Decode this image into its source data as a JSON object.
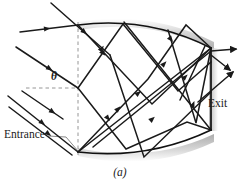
{
  "figure": {
    "caption": "(a)",
    "labels": {
      "entrance": "Entrance",
      "exit": "Exit",
      "angle": "θ"
    },
    "colors": {
      "ray": "#1a1a1a",
      "surface": "#111111",
      "shadow": "#b9b9b9",
      "dashed_guide": "#8a8a8a",
      "leader": "#7a7a7a",
      "background": "#ffffff",
      "text": "#1a1a1a"
    },
    "geometry": {
      "top_surface": "curved arc from (78,25) through (150,18) to (211,48)",
      "bottom_surface": "curved arc from (78,152) through (150,158) to (211,130)",
      "exit_face": "near-vertical segment from (211,48) to (211,130)",
      "normal_guide_x": 78,
      "horizontal_guide_y": 88
    },
    "rays": {
      "incoming_count": 4,
      "exit_count": 3,
      "internal_bounce_count": 14
    }
  }
}
